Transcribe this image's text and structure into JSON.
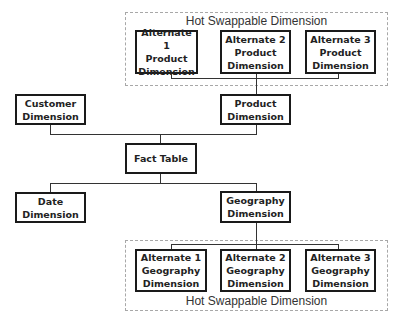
{
  "top_group": {
    "label": "Hot Swappable Dimension",
    "items": [
      {
        "label": "Alternate 1\nProduct\nDimension"
      },
      {
        "label": "Alternate 2\nProduct\nDimension"
      },
      {
        "label": "Alternate 3\nProduct\nDimension"
      }
    ]
  },
  "nodes": {
    "customer": "Customer\nDimension",
    "product": "Product\nDimension",
    "fact": "Fact Table",
    "date": "Date\nDimension",
    "geography": "Geography\nDimension"
  },
  "bottom_group": {
    "label": "Hot Swappable Dimension",
    "items": [
      {
        "label": "Alternate 1\nGeography\nDimension"
      },
      {
        "label": "Alternate 2\nGeography\nDimension"
      },
      {
        "label": "Alternate 3\nGeography\nDimension"
      }
    ]
  }
}
